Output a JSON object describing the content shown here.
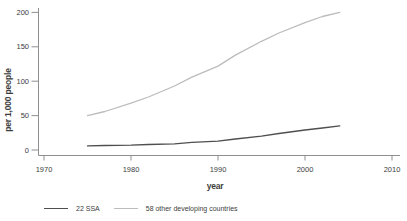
{
  "figure": {
    "background": "#ffffff"
  },
  "chart_data": {
    "type": "line",
    "title": "",
    "xlabel": "year",
    "ylabel": "per 1,000 people",
    "x": [
      1975,
      1977,
      1980,
      1982,
      1985,
      1987,
      1990,
      1992,
      1995,
      1997,
      2000,
      2002,
      2004
    ],
    "series": [
      {
        "name": "22 SSA",
        "color": "#4f4f4f",
        "values": [
          6,
          6.5,
          7,
          8,
          9,
          11,
          13,
          16,
          20,
          24,
          29,
          32,
          35
        ]
      },
      {
        "name": "58 other developing countries",
        "color": "#bcbcbc",
        "values": [
          50,
          56,
          68,
          77,
          93,
          106,
          122,
          138,
          158,
          170,
          185,
          194,
          200
        ]
      }
    ],
    "x_ticks": [
      1970,
      1980,
      1990,
      2000,
      2010
    ],
    "y_ticks": [
      0,
      50,
      100,
      150,
      200
    ],
    "xlim": [
      1970,
      2010
    ],
    "ylim": [
      0,
      200
    ],
    "grid": false,
    "legend_position": "bottom"
  },
  "style": {
    "axis_color": "#8f8f8f",
    "tick_text_color": "#3d3d3d",
    "tick_font_size": 7.5
  }
}
